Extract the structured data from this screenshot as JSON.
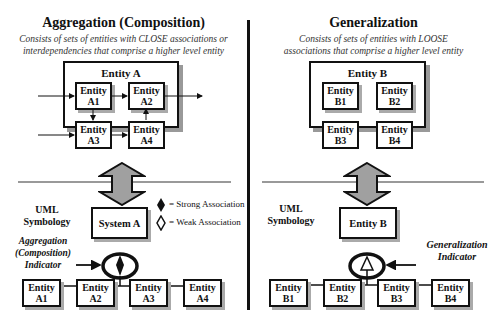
{
  "left": {
    "title": "Aggregation (Composition)",
    "subtitle_line1": "Consists of sets of entities with CLOSE associations or",
    "subtitle_line2": "interdependencies that comprise a higher level entity",
    "container_title": "Entity A",
    "inner_entities": [
      {
        "line1": "Entity",
        "line2": "A1"
      },
      {
        "line1": "Entity",
        "line2": "A2"
      },
      {
        "line1": "Entity",
        "line2": "A3"
      },
      {
        "line1": "Entity",
        "line2": "A4"
      }
    ],
    "uml_label_line1": "UML",
    "uml_label_line2": "Symbology",
    "parent": "System A",
    "indicator_line1": "Aggregation",
    "indicator_line2": "(Composition)",
    "indicator_line3": "Indicator",
    "children": [
      {
        "line1": "Entity",
        "line2": "A1"
      },
      {
        "line1": "Entity",
        "line2": "A2"
      },
      {
        "line1": "Entity",
        "line2": "A3"
      },
      {
        "line1": "Entity",
        "line2": "A4"
      }
    ],
    "legend": {
      "strong": "= Strong Association",
      "weak": "= Weak Association"
    }
  },
  "right": {
    "title": "Generalization",
    "subtitle_line1": "Consists of sets of entities with LOOSE",
    "subtitle_line2": "associations that comprise a higher level entity",
    "container_title": "Entity B",
    "inner_entities": [
      {
        "line1": "Entity",
        "line2": "B1"
      },
      {
        "line1": "Entity",
        "line2": "B2"
      },
      {
        "line1": "Entity",
        "line2": "B3"
      },
      {
        "line1": "Entity",
        "line2": "B4"
      }
    ],
    "uml_label_line1": "UML",
    "uml_label_line2": "Symbology",
    "parent": "Entity B",
    "indicator_line1": "Generalization",
    "indicator_line2": "Indicator",
    "children": [
      {
        "line1": "Entity",
        "line2": "B1"
      },
      {
        "line1": "Entity",
        "line2": "B2"
      },
      {
        "line1": "Entity",
        "line2": "B3"
      },
      {
        "line1": "Entity",
        "line2": "B4"
      }
    ]
  },
  "colors": {
    "arrow_fill": "#a0a0a0",
    "divider": "#111111",
    "hline": "#999999"
  }
}
